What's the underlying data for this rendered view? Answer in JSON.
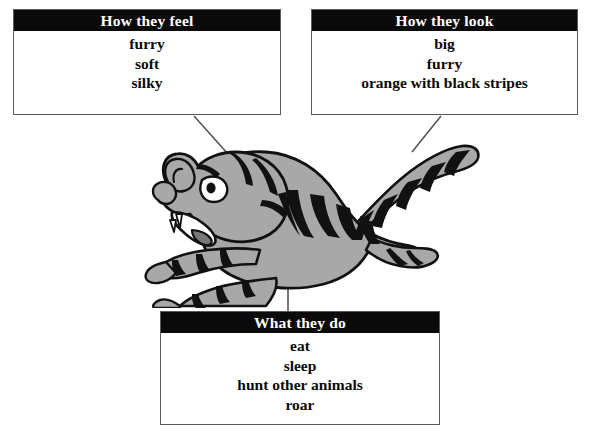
{
  "diagram": {
    "colors": {
      "header_bg": "#0a0a0a",
      "header_text": "#ffffff",
      "box_border": "#5b5b5b",
      "box_bg": "#ffffff",
      "page_bg": "#ffffff",
      "animal_fill": "#a8a8a8",
      "animal_outline": "#111111",
      "stripe": "#111111",
      "connector": "#555555"
    },
    "boxes": [
      {
        "id": "how-they-feel",
        "header": "How they feel",
        "entries": [
          "furry",
          "soft",
          "silky"
        ]
      },
      {
        "id": "how-they-look",
        "header": "How they look",
        "entries": [
          "big",
          "furry",
          "orange with black stripes"
        ]
      },
      {
        "id": "what-they-do",
        "header": "What they do",
        "entries": [
          "eat",
          "sleep",
          "hunt other animals",
          "roar"
        ]
      }
    ],
    "connectors": [
      {
        "from": "how-they-feel",
        "to": "tiger-head",
        "style": "diagonal-down-right"
      },
      {
        "from": "how-they-look",
        "to": "tiger-tail",
        "style": "diagonal-down-left"
      },
      {
        "from": "what-they-do",
        "to": "tiger-body",
        "style": "vertical"
      }
    ],
    "illustration": {
      "name": "leaping-tiger-illustration",
      "description": "cartoon tiger leaping to the left with stripes"
    }
  }
}
